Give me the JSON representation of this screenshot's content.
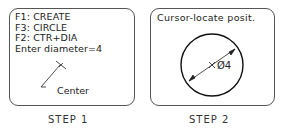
{
  "step1": {
    "menu_lines": [
      "F1: CREATE",
      "F3: CIRCLE",
      "F2: CTR+DIA",
      "Enter diameter=4"
    ],
    "callout": "Center",
    "caption": "STEP 1"
  },
  "step2": {
    "prompt": "Cursor-locate posit.",
    "dimension": "Ø4",
    "caption": "STEP 2"
  }
}
